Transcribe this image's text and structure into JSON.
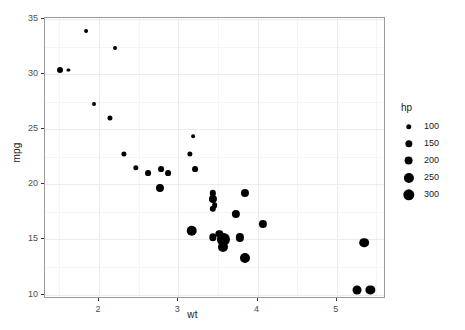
{
  "chart_data": {
    "type": "scatter",
    "title": "",
    "xlabel": "wt",
    "ylabel": "mpg",
    "xlim": [
      1.32,
      5.62
    ],
    "ylim": [
      9.6,
      35.1
    ],
    "xticks": [
      "2",
      "3",
      "4",
      "5"
    ],
    "xtick_values": [
      2,
      3,
      4,
      5
    ],
    "yticks": [
      "10",
      "15",
      "20",
      "25",
      "30",
      "35"
    ],
    "ytick_values": [
      10,
      15,
      20,
      25,
      30,
      35
    ],
    "x_minor_values": [
      1.5,
      2.5,
      3.5,
      4.5,
      5.5
    ],
    "y_minor_values": [
      12.5,
      17.5,
      22.5,
      27.5,
      32.5
    ],
    "grid": true,
    "legend": {
      "title": "hp",
      "position": "right",
      "size_mapping": true,
      "entries": [
        {
          "label": "100",
          "value": 100
        },
        {
          "label": "150",
          "value": 150
        },
        {
          "label": "200",
          "value": 200
        },
        {
          "label": "250",
          "value": 250
        },
        {
          "label": "300",
          "value": 300
        }
      ]
    },
    "size_by": "hp",
    "size_range": [
      52,
      335
    ],
    "point_color": "#000000",
    "points": [
      {
        "x": 2.62,
        "y": 21.0,
        "size": 110
      },
      {
        "x": 2.875,
        "y": 21.0,
        "size": 110
      },
      {
        "x": 2.32,
        "y": 22.8,
        "size": 93
      },
      {
        "x": 3.215,
        "y": 21.4,
        "size": 110
      },
      {
        "x": 3.44,
        "y": 18.7,
        "size": 175
      },
      {
        "x": 3.46,
        "y": 18.1,
        "size": 105
      },
      {
        "x": 3.57,
        "y": 14.3,
        "size": 245
      },
      {
        "x": 3.19,
        "y": 24.4,
        "size": 62
      },
      {
        "x": 3.15,
        "y": 22.8,
        "size": 95
      },
      {
        "x": 3.44,
        "y": 19.2,
        "size": 123
      },
      {
        "x": 3.44,
        "y": 17.8,
        "size": 123
      },
      {
        "x": 4.07,
        "y": 16.4,
        "size": 180
      },
      {
        "x": 3.73,
        "y": 17.3,
        "size": 180
      },
      {
        "x": 3.78,
        "y": 15.2,
        "size": 180
      },
      {
        "x": 5.25,
        "y": 10.4,
        "size": 205
      },
      {
        "x": 5.424,
        "y": 10.4,
        "size": 215
      },
      {
        "x": 5.345,
        "y": 14.7,
        "size": 230
      },
      {
        "x": 2.2,
        "y": 32.4,
        "size": 66
      },
      {
        "x": 1.615,
        "y": 30.4,
        "size": 52
      },
      {
        "x": 1.835,
        "y": 33.9,
        "size": 65
      },
      {
        "x": 2.465,
        "y": 21.5,
        "size": 97
      },
      {
        "x": 3.52,
        "y": 15.5,
        "size": 150
      },
      {
        "x": 3.435,
        "y": 15.2,
        "size": 150
      },
      {
        "x": 3.84,
        "y": 13.3,
        "size": 245
      },
      {
        "x": 3.845,
        "y": 19.2,
        "size": 175
      },
      {
        "x": 1.935,
        "y": 27.3,
        "size": 66
      },
      {
        "x": 2.14,
        "y": 26.0,
        "size": 91
      },
      {
        "x": 1.513,
        "y": 30.4,
        "size": 113
      },
      {
        "x": 3.17,
        "y": 15.8,
        "size": 264
      },
      {
        "x": 2.77,
        "y": 19.7,
        "size": 175
      },
      {
        "x": 3.57,
        "y": 15.0,
        "size": 335
      },
      {
        "x": 2.78,
        "y": 21.4,
        "size": 109
      }
    ]
  },
  "panel": {
    "background": "#ffffff",
    "border_color": "#9a9a9a",
    "grid_major_color": "#ebebeb",
    "grid_minor_color": "#f5f5f5"
  }
}
